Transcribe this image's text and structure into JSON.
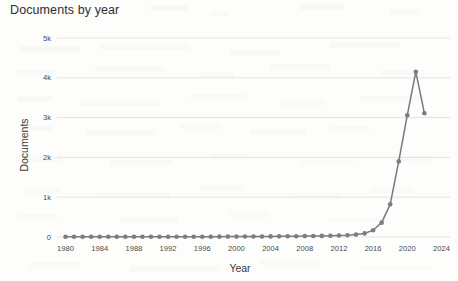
{
  "chart_data": {
    "type": "line",
    "title": "Documents by year",
    "xlabel": "Year",
    "ylabel": "Documents",
    "grid": "horizontal",
    "legend": "none",
    "xlim": [
      1979,
      2025
    ],
    "ylim": [
      0,
      5000
    ],
    "xticks": [
      1980,
      1984,
      1988,
      1992,
      1996,
      2000,
      2004,
      2008,
      2012,
      2016,
      2020,
      2024
    ],
    "xtick_labels": [
      "1980",
      "1984",
      "1988",
      "1992",
      "1996",
      "2000",
      "2004",
      "2008",
      "2012",
      "2016",
      "2020",
      "2024"
    ],
    "yticks": [
      0,
      1000,
      2000,
      3000,
      4000,
      5000
    ],
    "ytick_labels": [
      "0",
      "1k",
      "2k",
      "3k",
      "4k",
      "5k"
    ],
    "marker": "circle",
    "line_color": "#7a7a7a",
    "marker_color": "#7d7d7d",
    "grid_color": "#d9d9d9",
    "x": [
      1980,
      1981,
      1982,
      1983,
      1984,
      1985,
      1986,
      1987,
      1988,
      1989,
      1990,
      1991,
      1992,
      1993,
      1994,
      1995,
      1996,
      1997,
      1998,
      1999,
      2000,
      2001,
      2002,
      2003,
      2004,
      2005,
      2006,
      2007,
      2008,
      2009,
      2010,
      2011,
      2012,
      2013,
      2014,
      2015,
      2016,
      2017,
      2018,
      2019,
      2020,
      2021,
      2022
    ],
    "values": [
      5,
      5,
      5,
      5,
      5,
      5,
      5,
      5,
      5,
      5,
      6,
      6,
      6,
      6,
      7,
      7,
      8,
      8,
      9,
      10,
      10,
      12,
      12,
      14,
      15,
      16,
      18,
      20,
      22,
      25,
      28,
      32,
      38,
      45,
      60,
      90,
      170,
      360,
      820,
      1900,
      3060,
      4150,
      3110
    ]
  },
  "colors": {
    "background": "#fdfdfc",
    "title_text": "#2f2f2f",
    "axis_text": "#3a3a3a",
    "tick_text": "#4a4a4a"
  }
}
